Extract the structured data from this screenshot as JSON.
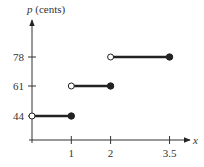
{
  "chart_data": {
    "type": "line",
    "subtype": "step",
    "title": "",
    "xlabel": "x",
    "ylabel": "p (cents)",
    "ylabel_var": "p",
    "ylabel_unit": "(cents)",
    "x_ticks": [
      {
        "value": 1,
        "label": "1"
      },
      {
        "value": 2,
        "label": "2"
      },
      {
        "value": 3.5,
        "label": "3.5"
      }
    ],
    "y_ticks": [
      {
        "value": 44,
        "label": "44"
      },
      {
        "value": 61,
        "label": "61"
      },
      {
        "value": 78,
        "label": "78"
      }
    ],
    "segments": [
      {
        "x_start": 0,
        "x_end": 1,
        "y": 44,
        "start_open": true,
        "end_closed": true
      },
      {
        "x_start": 1,
        "x_end": 2,
        "y": 61,
        "start_open": true,
        "end_closed": true
      },
      {
        "x_start": 2,
        "x_end": 3.5,
        "y": 78,
        "start_open": true,
        "end_closed": true
      }
    ],
    "grid": false,
    "colors": {
      "axis": "#333333",
      "line": "#222222",
      "open_fill": "#ffffff"
    }
  }
}
